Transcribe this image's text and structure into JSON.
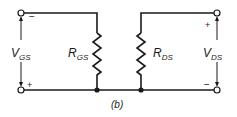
{
  "figure_label": "(b)",
  "left_port": {
    "voltage_label": "V",
    "voltage_subscript": "GS",
    "top_polarity": "−",
    "bottom_polarity": "+"
  },
  "right_port": {
    "voltage_label": "V",
    "voltage_subscript": "DS",
    "top_polarity": "+",
    "bottom_polarity": "−"
  },
  "resistors": [
    {
      "label": "R",
      "subscript": "GS"
    },
    {
      "label": "R",
      "subscript": "DS"
    }
  ]
}
